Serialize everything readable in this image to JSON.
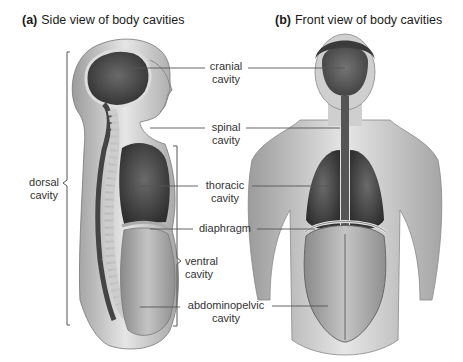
{
  "panels": [
    {
      "letter": "(a)",
      "title": "Side view of body cavities"
    },
    {
      "letter": "(b)",
      "title": "Front view of body cavities"
    }
  ],
  "labels": {
    "cranial": [
      "cranial",
      "cavity"
    ],
    "spinal": [
      "spinal",
      "cavity"
    ],
    "thoracic": [
      "thoracic",
      "cavity"
    ],
    "diaphragm": "diaphragm",
    "abdominopelvic": [
      "abdominopelvic",
      "cavity"
    ],
    "dorsal": [
      "dorsal",
      "cavity"
    ],
    "ventral": [
      "ventral",
      "cavity"
    ]
  },
  "colors": {
    "skin": "#d9d9d9",
    "cavity_dark": "#4a4a4a",
    "cavity_mid": "#7a7a7a",
    "abdomen": "#a8a8a8",
    "leader_line": "#555555"
  }
}
